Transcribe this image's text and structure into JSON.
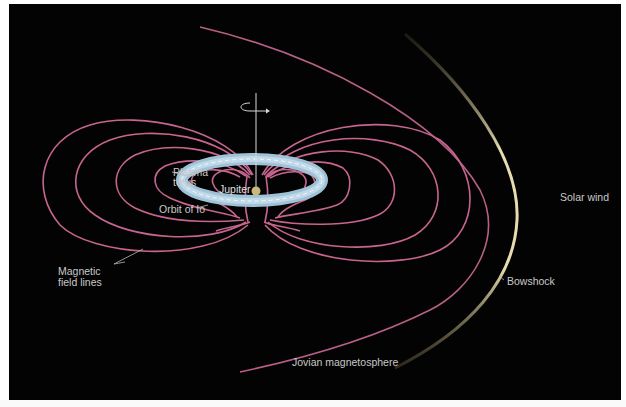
{
  "diagram": {
    "title": "Jovian magnetosphere",
    "colors": {
      "background": "#030303",
      "field_lines": "#c7658f",
      "torus": "#b8d4e6",
      "jupiter": "#c9b779",
      "bowshock": "#d8cda0",
      "solar_wind": "#e8dfb0",
      "label": "#c9c9c9"
    },
    "labels": {
      "plasma_torus_line1": "Plasma",
      "plasma_torus_line2": "torus",
      "jupiter": "Jupiter",
      "orbit_of_io": "Orbit of Io",
      "magnetic_line1": "Magnetic",
      "magnetic_line2": "field lines",
      "solar_wind": "Solar wind",
      "bowshock": "Bowshock",
      "magnetosphere": "Jovian magnetosphere"
    },
    "icons": {
      "rotation_axis": "rotation-arrow"
    }
  }
}
